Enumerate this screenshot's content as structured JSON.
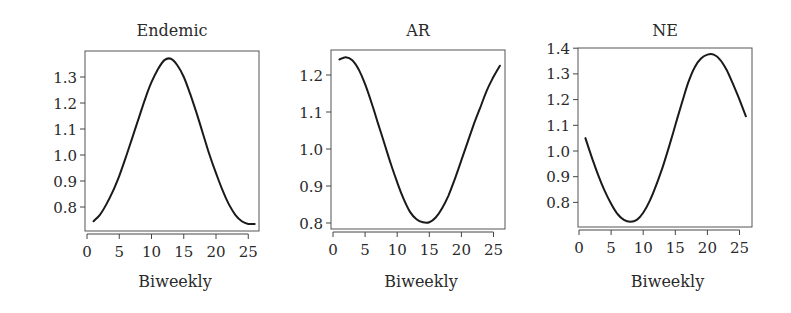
{
  "figure": {
    "panel_count": 3
  },
  "chart_data": [
    {
      "type": "line",
      "title": "Endemic",
      "xlabel": "Biweekly",
      "ylabel": "",
      "xlim": [
        0,
        27
      ],
      "ylim": [
        0.715,
        1.395
      ],
      "xticks": [
        0,
        5,
        10,
        15,
        20,
        25
      ],
      "yticks": [
        0.8,
        0.9,
        1.0,
        1.1,
        1.2,
        1.3
      ],
      "ytick_labels": [
        "0.8",
        "0.9",
        "1.0",
        "1.1",
        "1.2",
        "1.3"
      ],
      "grid": false,
      "x": [
        1,
        2,
        3,
        4,
        5,
        6,
        7,
        8,
        9,
        10,
        11,
        12,
        13,
        14,
        15,
        16,
        17,
        18,
        19,
        20,
        21,
        22,
        23,
        24,
        25,
        26
      ],
      "values": [
        0.745,
        0.77,
        0.81,
        0.86,
        0.92,
        0.99,
        1.065,
        1.14,
        1.215,
        1.28,
        1.33,
        1.365,
        1.37,
        1.345,
        1.3,
        1.235,
        1.16,
        1.08,
        1.0,
        0.93,
        0.865,
        0.81,
        0.77,
        0.745,
        0.735,
        0.735
      ],
      "frame": {
        "left": 85,
        "right": 259,
        "top": 51,
        "bottom": 231
      },
      "axis_map": {
        "x0": 87,
        "x_per_unit": 6.45,
        "y_ref_value": 1.0,
        "y_ref_px": 155,
        "px_per_unit": 260
      }
    },
    {
      "type": "line",
      "title": "AR",
      "xlabel": "Biweekly",
      "ylabel": "",
      "xlim": [
        0,
        27
      ],
      "ylim": [
        0.78,
        1.265
      ],
      "xticks": [
        0,
        5,
        10,
        15,
        20,
        25
      ],
      "yticks": [
        0.8,
        0.9,
        1.0,
        1.1,
        1.2
      ],
      "ytick_labels": [
        "0.8",
        "0.9",
        "1.0",
        "1.1",
        "1.2"
      ],
      "grid": false,
      "x": [
        1,
        2,
        3,
        4,
        5,
        6,
        7,
        8,
        9,
        10,
        11,
        12,
        13,
        14,
        15,
        16,
        17,
        18,
        19,
        20,
        21,
        22,
        23,
        24,
        25,
        26
      ],
      "values": [
        1.242,
        1.248,
        1.24,
        1.215,
        1.175,
        1.125,
        1.07,
        1.015,
        0.96,
        0.91,
        0.865,
        0.83,
        0.81,
        0.802,
        0.802,
        0.815,
        0.84,
        0.875,
        0.92,
        0.97,
        1.02,
        1.07,
        1.115,
        1.16,
        1.195,
        1.225
      ],
      "frame": {
        "left": 331,
        "right": 505,
        "top": 50,
        "bottom": 229
      },
      "axis_map": {
        "x0": 333,
        "x_per_unit": 6.42,
        "y_ref_value": 1.0,
        "y_ref_px": 149,
        "px_per_unit": 370
      }
    },
    {
      "type": "line",
      "title": "NE",
      "xlabel": "Biweekly",
      "ylabel": "",
      "xlim": [
        0,
        27
      ],
      "ylim": [
        0.705,
        1.4
      ],
      "xticks": [
        0,
        5,
        10,
        15,
        20,
        25
      ],
      "yticks": [
        0.8,
        0.9,
        1.0,
        1.1,
        1.2,
        1.3,
        1.4
      ],
      "ytick_labels": [
        "0.8",
        "0.9",
        "1.0",
        "1.1",
        "1.2",
        "1.3",
        "1.4"
      ],
      "grid": false,
      "x": [
        1,
        2,
        3,
        4,
        5,
        6,
        7,
        8,
        9,
        10,
        11,
        12,
        13,
        14,
        15,
        16,
        17,
        18,
        19,
        20,
        21,
        22,
        23,
        24,
        25,
        26
      ],
      "values": [
        1.05,
        0.975,
        0.905,
        0.845,
        0.795,
        0.755,
        0.732,
        0.725,
        0.732,
        0.76,
        0.805,
        0.865,
        0.935,
        1.015,
        1.1,
        1.185,
        1.265,
        1.325,
        1.36,
        1.375,
        1.375,
        1.355,
        1.315,
        1.26,
        1.2,
        1.135
      ],
      "frame": {
        "left": 578,
        "right": 752,
        "top": 48,
        "bottom": 227
      },
      "axis_map": {
        "x0": 579,
        "x_per_unit": 6.42,
        "y_ref_value": 1.0,
        "y_ref_px": 151,
        "px_per_unit": 257
      }
    }
  ]
}
